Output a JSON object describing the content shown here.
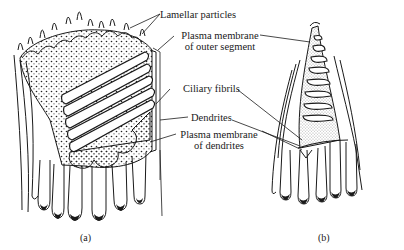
{
  "figure": {
    "panels": [
      {
        "id": "a",
        "caption": "(a)"
      },
      {
        "id": "b",
        "caption": "(b)"
      }
    ],
    "labels": {
      "lamellar_particles": "Lamellar particles",
      "plasma_outer_line1": "Plasma membrane",
      "plasma_outer_line2": "of outer segment",
      "ciliary_fibrils": "Ciliary fibrils",
      "dendrites": "Dendrites",
      "plasma_dendrites_line1": "Plasma membrane",
      "plasma_dendrites_line2": "of dendrites"
    },
    "colors": {
      "ink": "#1a1a1a",
      "background": "#ffffff"
    }
  }
}
